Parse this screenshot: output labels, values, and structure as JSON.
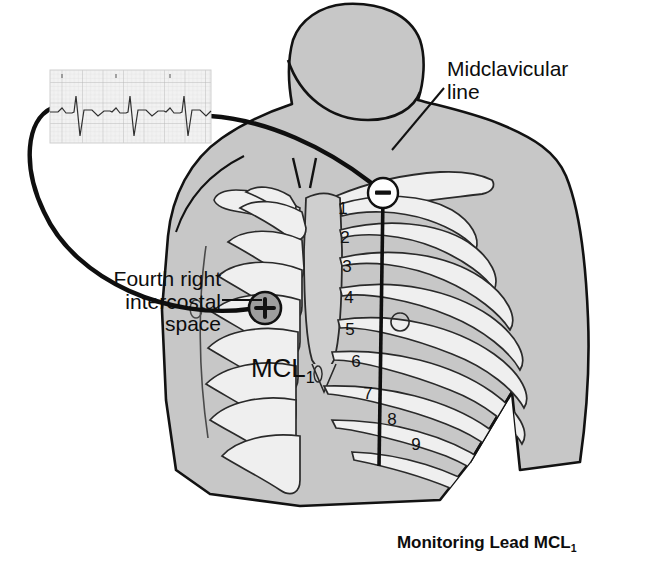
{
  "figure": {
    "caption": "Monitoring Lead MCL",
    "caption_subscript": "1",
    "title_full": "Monitoring Lead MCL1"
  },
  "labels": {
    "midclavicular_line": "Midclavicular\nline",
    "fourth_right_intercostal_space": "Fourth right\nintercostal\nspace",
    "electrode_site": "MCL",
    "electrode_site_subscript": "1"
  },
  "electrodes": [
    {
      "name": "negative-electrode",
      "symbol": "−",
      "x": 383,
      "y": 193,
      "r": 15,
      "fill": "#ffffff",
      "stroke": "#111111"
    },
    {
      "name": "positive-electrode",
      "symbol": "+",
      "x": 265,
      "y": 308,
      "r": 16,
      "fill": "#9e9e9e",
      "stroke": "#111111"
    }
  ],
  "ribs": {
    "left_numbers": [
      "1",
      "2",
      "3",
      "4",
      "5",
      "6",
      "7",
      "8",
      "9"
    ]
  },
  "ecg_strip": {
    "label": "ecg-rhythm-strip",
    "beats": 3,
    "morphology": "negative QRS deflections with small upright P waves"
  },
  "colors": {
    "skin_fill": "#c7c7c7",
    "bone_fill": "#efefef",
    "bone_shadow": "#b5b5b5",
    "outline": "#121212",
    "ecg_paper": "#f2f2f2",
    "ecg_grid": "#d2d2d2",
    "ecg_grid_major": "#b9b9b9",
    "ecg_trace": "#303030",
    "text": "#0d0d0d",
    "background": "#ffffff"
  }
}
